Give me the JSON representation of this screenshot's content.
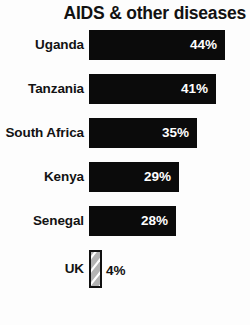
{
  "chart_data": {
    "type": "bar",
    "orientation": "horizontal",
    "title": "AIDS & other diseases",
    "xlabel": "",
    "ylabel": "",
    "xlim": [
      0,
      44
    ],
    "grid": false,
    "legend": false,
    "value_suffix": "%",
    "categories": [
      "Uganda",
      "Tanzania",
      "South Africa",
      "Kenya",
      "Senegal",
      "UK"
    ],
    "values": [
      44,
      41,
      35,
      29,
      28,
      4
    ],
    "value_labels": [
      "44%",
      "41%",
      "35%",
      "29%",
      "28%",
      "4%"
    ],
    "series": [
      {
        "name": "AIDS & other diseases",
        "values": [
          44,
          41,
          35,
          29,
          28,
          4
        ]
      }
    ],
    "bars": [
      {
        "category": "Uganda",
        "value": 44,
        "label": "44%",
        "style": "solid",
        "label_position": "inside"
      },
      {
        "category": "Tanzania",
        "value": 41,
        "label": "41%",
        "style": "solid",
        "label_position": "inside"
      },
      {
        "category": "South Africa",
        "value": 35,
        "label": "35%",
        "style": "solid",
        "label_position": "inside"
      },
      {
        "category": "Kenya",
        "value": 29,
        "label": "29%",
        "style": "solid",
        "label_position": "inside"
      },
      {
        "category": "Senegal",
        "value": 28,
        "label": "28%",
        "style": "solid",
        "label_position": "inside"
      },
      {
        "category": "UK",
        "value": 4,
        "label": "4%",
        "style": "hatched",
        "label_position": "outside"
      }
    ],
    "colors": {
      "background": "#fdfdfd",
      "bar_solid": "#0b0b0b",
      "bar_hatched_fill": "#b3b3b3",
      "bar_hatched_stroke": "#111111",
      "hatch_lines": "#ffffff",
      "value_text_inside": "#ffffff",
      "value_text_outside": "#111111",
      "category_text": "#131313",
      "title_text": "#121212"
    }
  }
}
